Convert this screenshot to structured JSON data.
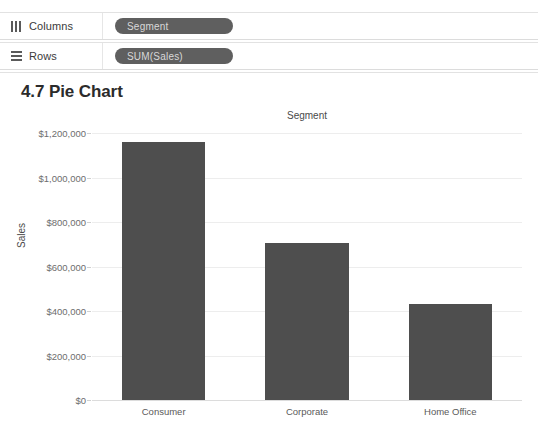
{
  "shelves": [
    {
      "icon": "columns-icon",
      "label": "Columns",
      "pill": "Segment"
    },
    {
      "icon": "rows-icon",
      "label": "Rows",
      "pill": "SUM(Sales)"
    }
  ],
  "worksheet": {
    "title": "4.7 Pie Chart"
  },
  "colors": {
    "bar": "#4e4e4e",
    "pill": "#5f5f5f",
    "gridline": "#ededed"
  },
  "chart_data": {
    "type": "bar",
    "title": "Segment",
    "xlabel": "",
    "ylabel": "Sales",
    "categories": [
      "Consumer",
      "Corporate",
      "Home Office"
    ],
    "values": [
      1161401,
      706146,
      429653
    ],
    "ylim": [
      0,
      1200000
    ],
    "yticks": [
      0,
      200000,
      400000,
      600000,
      800000,
      1000000,
      1200000
    ],
    "ytick_labels": [
      "$0",
      "$200,000",
      "$400,000",
      "$600,000",
      "$800,000",
      "$1,000,000",
      "$1,200,000"
    ],
    "grid": true,
    "legend": false,
    "orientation": "vertical"
  }
}
